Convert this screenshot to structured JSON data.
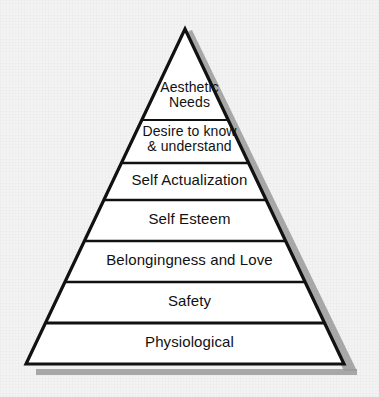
{
  "diagram": {
    "type": "pyramid",
    "name": "maslow-hierarchy-of-needs",
    "background_color": "#f3f3f3",
    "outline_color": "#111111",
    "fill_color": "#ffffff",
    "shadow_color": "#9a9a9a",
    "text_color": "#111111",
    "apex": {
      "x": 185,
      "y": 29
    },
    "base": {
      "left_x": 26,
      "right_x": 344,
      "y": 364
    },
    "divider_y": [
      120,
      163,
      200,
      241,
      282,
      323
    ],
    "tiers": [
      {
        "index": 0,
        "label": "Aesthetic\nNeeds",
        "label_center_y": 97,
        "font_size": 14
      },
      {
        "index": 1,
        "label": "Desire to know\n& understand",
        "label_center_y": 141,
        "font_size": 14
      },
      {
        "index": 2,
        "label": "Self Actualization",
        "label_center_y": 181,
        "font_size": 15
      },
      {
        "index": 3,
        "label": "Self Esteem",
        "label_center_y": 220,
        "font_size": 15
      },
      {
        "index": 4,
        "label": "Belongingness and Love",
        "label_center_y": 261,
        "font_size": 15
      },
      {
        "index": 5,
        "label": "Safety",
        "label_center_y": 302,
        "font_size": 15
      },
      {
        "index": 6,
        "label": "Physiological",
        "label_center_y": 343,
        "font_size": 15
      }
    ]
  }
}
